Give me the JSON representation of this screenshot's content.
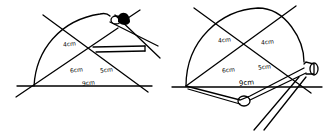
{
  "figures": [
    {
      "id": "left",
      "labels": {
        "upper_left": "4cm",
        "lower_left": "6cm",
        "lower_right": "5cm",
        "base": "9cm"
      },
      "tool": "pencil-compass"
    },
    {
      "id": "right",
      "labels": {
        "upper_left": "4cm",
        "upper_right": "4cm",
        "lower_left": "6cm",
        "lower_right": "5cm",
        "base": "9cm"
      },
      "tool": "compass"
    }
  ],
  "colors": {
    "ink": "#000000",
    "background": "#ffffff"
  }
}
